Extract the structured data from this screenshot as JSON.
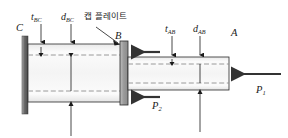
{
  "figure": {
    "background": "#ffffff",
    "colors": {
      "line": "#1a1a1a",
      "wall_fill": "#8c8c8c",
      "tube_fill": "#f2f2f2",
      "cap_fill": "#9a9a9a",
      "dash": "#9a9a9a",
      "arrow": "#333333"
    }
  },
  "labels": {
    "wall_point": "C",
    "junction_point": "B",
    "free_end_point": "A",
    "thickness_bc": {
      "base": "t",
      "sub": "BC"
    },
    "diameter_bc": {
      "base": "d",
      "sub": "BC"
    },
    "thickness_ab": {
      "base": "t",
      "sub": "AB"
    },
    "diameter_ab": {
      "base": "d",
      "sub": "AB"
    },
    "cap_plate": "캡 플레이트",
    "load_p1": {
      "base": "P",
      "sub": "1"
    },
    "load_p2": {
      "base": "P",
      "sub": "2"
    }
  },
  "geometry": {
    "wall": {
      "x": 22,
      "y": 36,
      "width": 6,
      "height": 78
    },
    "tube_bc": {
      "x": 28,
      "y": 44,
      "width": 93,
      "height": 58
    },
    "cap_plate": {
      "x": 120,
      "y": 41,
      "width": 8,
      "height": 64
    },
    "tube_ab": {
      "x": 128,
      "y": 57,
      "width": 101,
      "height": 33
    }
  }
}
